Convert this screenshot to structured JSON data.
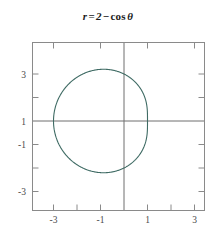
{
  "chart_data": {
    "type": "line",
    "title_parts": {
      "lhs": "r",
      "equals": "=",
      "constant": "2",
      "minus": "−",
      "function": "cos",
      "angle": "θ"
    },
    "equation": "r = 2 - cos(theta)",
    "coordinate_system": "polar",
    "xlabel": "",
    "ylabel": "",
    "xlim": [
      -3.9,
      3.5
    ],
    "ylim": [
      -3.9,
      3.5
    ],
    "grid": false,
    "legend": null,
    "axes_through_origin": true,
    "curve_color": "#3f6b64",
    "axis_color": "#6e6e6e",
    "frame_color": "#8a8a8a",
    "tick_label_color": "#4a4a4a",
    "background_color": "#ffffff",
    "x_ticks": [
      -3,
      -2,
      -1,
      0,
      1,
      2,
      3
    ],
    "x_tick_labels": [
      "-3",
      "",
      "-1",
      "",
      "1",
      "",
      "3"
    ],
    "y_ticks": [
      -3,
      -2,
      -1,
      0,
      1,
      2,
      3
    ],
    "y_tick_labels": [
      "-3",
      "",
      "-1",
      "",
      "1",
      "",
      "3"
    ],
    "x_labels_shown": [
      "-3",
      "-1",
      "1",
      "3"
    ],
    "y_labels_shown": [
      "3",
      "1",
      "-1",
      "-3"
    ],
    "curve_extent": {
      "x_min": -3.0,
      "x_max": 1.0,
      "y_min": -2.2,
      "y_max": 2.2
    },
    "theta_range_degrees": [
      0,
      360
    ],
    "points_polar": [
      {
        "theta_deg": 0,
        "r": 1.0
      },
      {
        "theta_deg": 30,
        "r": 1.134
      },
      {
        "theta_deg": 60,
        "r": 1.5
      },
      {
        "theta_deg": 90,
        "r": 2.0
      },
      {
        "theta_deg": 120,
        "r": 2.5
      },
      {
        "theta_deg": 150,
        "r": 2.866
      },
      {
        "theta_deg": 180,
        "r": 3.0
      },
      {
        "theta_deg": 210,
        "r": 2.866
      },
      {
        "theta_deg": 240,
        "r": 2.5
      },
      {
        "theta_deg": 270,
        "r": 2.0
      },
      {
        "theta_deg": 300,
        "r": 1.5
      },
      {
        "theta_deg": 330,
        "r": 1.134
      },
      {
        "theta_deg": 360,
        "r": 1.0
      }
    ]
  }
}
